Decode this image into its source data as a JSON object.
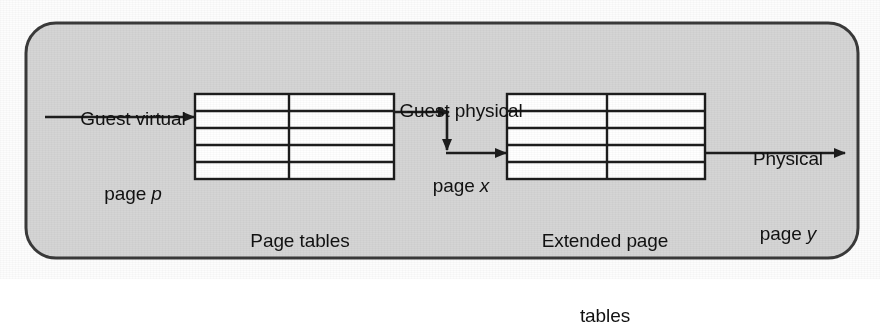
{
  "diagram": {
    "panel": {
      "fill_color": "#d5d5d5",
      "stroke_color": "#3a3a3a",
      "corner_radius": 30
    },
    "line_color": "#1d1d1d",
    "table_fill_color": "#ffffff",
    "labels": {
      "guest_virtual_line1": "Guest virtual",
      "guest_virtual_line2_prefix": "page ",
      "guest_virtual_line2_var": "p",
      "guest_physical_line1": "Guest physical",
      "guest_physical_line2_prefix": "page ",
      "guest_physical_line2_var": "x",
      "physical_out_line1": "Physical",
      "physical_out_line2_prefix": "page ",
      "physical_out_line2_var": "y"
    },
    "tables": [
      {
        "name": "page-tables",
        "caption_line1": "Page tables",
        "caption_line2": "",
        "rows": 5,
        "columns": 2
      },
      {
        "name": "extended-page-tables",
        "caption_line1": "Extended page",
        "caption_line2": "tables",
        "rows": 5,
        "columns": 2
      }
    ],
    "arrows": [
      {
        "name": "guest-virtual-input-arrow",
        "direction": "right"
      },
      {
        "name": "guest-physical-arrow-right",
        "direction": "right"
      },
      {
        "name": "guest-physical-arrow-down",
        "direction": "down"
      },
      {
        "name": "extended-table-input-arrow",
        "direction": "right"
      },
      {
        "name": "physical-output-arrow",
        "direction": "right"
      }
    ]
  }
}
